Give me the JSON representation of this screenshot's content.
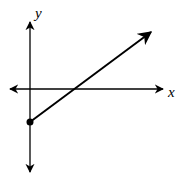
{
  "graph": {
    "x_axis_label": "x",
    "y_axis_label": "y",
    "ray": {
      "start_point": "closed dot on negative y-axis",
      "direction": "up and to the right",
      "crosses_x_axis": "positive x"
    },
    "colors": {
      "ink": "#000000",
      "background": "#ffffff"
    }
  }
}
